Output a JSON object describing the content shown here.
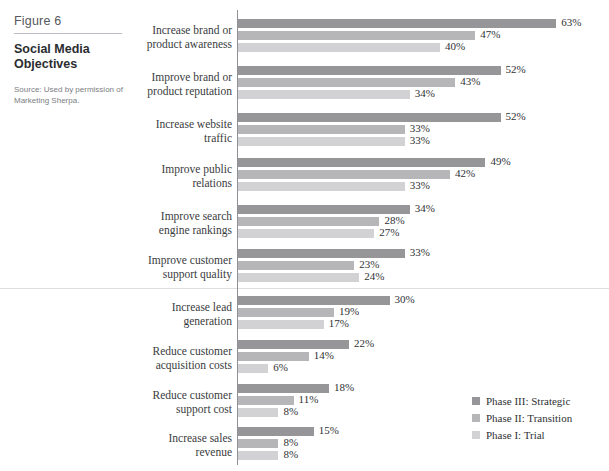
{
  "caption": {
    "figure_number": "Figure 6",
    "title": "Social Media Objectives",
    "source": "Source: Used by permission of Marketing Sherpa."
  },
  "legend": {
    "position": "bottom-right",
    "items": [
      {
        "label": "Phase III: Strategic",
        "color": "#969699"
      },
      {
        "label": "Phase II: Transition",
        "color": "#b6b6b8"
      },
      {
        "label": "Phase I: Trial",
        "color": "#d2d2d4"
      }
    ]
  },
  "chart_data": {
    "type": "bar",
    "orientation": "horizontal",
    "title": "Social Media Objectives",
    "xlabel": "",
    "ylabel": "",
    "xlim": [
      0,
      70
    ],
    "grid": false,
    "legend_position": "bottom-right",
    "categories": [
      "Increase brand or product awareness",
      "Improve brand or product reputation",
      "Increase website traffic",
      "Improve public relations",
      "Improve search engine rankings",
      "Improve customer support quality",
      "Increase lead generation",
      "Reduce customer acquisition costs",
      "Reduce customer support cost",
      "Increase sales revenue"
    ],
    "series": [
      {
        "name": "Phase III: Strategic",
        "color": "#969699",
        "values": [
          63,
          52,
          52,
          49,
          34,
          33,
          30,
          22,
          18,
          15
        ]
      },
      {
        "name": "Phase II: Transition",
        "color": "#b6b6b8",
        "values": [
          47,
          43,
          33,
          42,
          28,
          23,
          19,
          14,
          11,
          8
        ]
      },
      {
        "name": "Phase I: Trial",
        "color": "#d2d2d4",
        "values": [
          40,
          34,
          33,
          33,
          27,
          24,
          17,
          6,
          8,
          8
        ]
      }
    ],
    "value_labels": [
      [
        "63%",
        "47%",
        "40%"
      ],
      [
        "52%",
        "43%",
        "34%"
      ],
      [
        "52%",
        "33%",
        "33%"
      ],
      [
        "49%",
        "42%",
        "33%"
      ],
      [
        "34%",
        "28%",
        "27%"
      ],
      [
        "33%",
        "23%",
        "24%"
      ],
      [
        "30%",
        "19%",
        "17%"
      ],
      [
        "22%",
        "14%",
        "6%"
      ],
      [
        "18%",
        "11%",
        "8%"
      ],
      [
        "15%",
        "8%",
        "8%"
      ]
    ]
  }
}
